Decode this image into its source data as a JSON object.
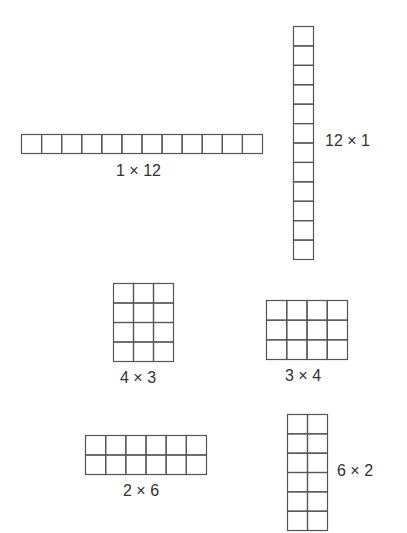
{
  "colors": {
    "line": "#555555",
    "text": "#333333",
    "background": "#ffffff"
  },
  "arrays": [
    {
      "id": "1x12",
      "label": "1 × 12",
      "rows": 1,
      "cols": 12,
      "x": 21,
      "y": 134,
      "width": 241,
      "height": 19,
      "label_x": 116,
      "label_y": 163
    },
    {
      "id": "12x1",
      "label": "12 × 1",
      "rows": 12,
      "cols": 1,
      "x": 293,
      "y": 26,
      "width": 20,
      "height": 233,
      "label_x": 325,
      "label_y": 133
    },
    {
      "id": "4x3",
      "label": "4 × 3",
      "rows": 4,
      "cols": 3,
      "x": 113,
      "y": 283,
      "width": 60,
      "height": 78,
      "label_x": 120,
      "label_y": 370
    },
    {
      "id": "3x4",
      "label": "3 × 4",
      "rows": 3,
      "cols": 4,
      "x": 266,
      "y": 300,
      "width": 81,
      "height": 59,
      "label_x": 285,
      "label_y": 368
    },
    {
      "id": "2x6",
      "label": "2 × 6",
      "rows": 2,
      "cols": 6,
      "x": 85,
      "y": 435,
      "width": 121,
      "height": 39,
      "label_x": 123,
      "label_y": 483
    },
    {
      "id": "6x2",
      "label": "6 × 2",
      "rows": 6,
      "cols": 2,
      "x": 287,
      "y": 414,
      "width": 40,
      "height": 116,
      "label_x": 337,
      "label_y": 463
    }
  ]
}
